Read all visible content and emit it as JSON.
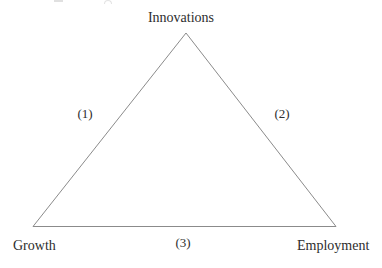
{
  "diagram": {
    "nodes": [
      {
        "id": "innovations",
        "label": "Innovations",
        "position": "top"
      },
      {
        "id": "growth",
        "label": "Growth",
        "position": "bottom-left"
      },
      {
        "id": "employment",
        "label": "Employment",
        "position": "bottom-right"
      }
    ],
    "edges": [
      {
        "id": "edge-1",
        "label": "(1)",
        "from": "growth",
        "to": "innovations"
      },
      {
        "id": "edge-2",
        "label": "(2)",
        "from": "innovations",
        "to": "employment"
      },
      {
        "id": "edge-3",
        "label": "(3)",
        "from": "growth",
        "to": "employment"
      }
    ],
    "colors": {
      "background": "#ffffff",
      "line": "#8b8b8b",
      "text": "#2d2d2d"
    }
  }
}
